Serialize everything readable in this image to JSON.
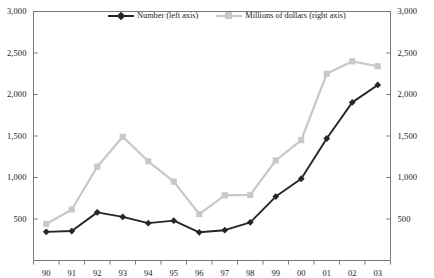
{
  "chart_data": {
    "type": "line",
    "title": "",
    "subtitle": "",
    "xlabel": "",
    "ylabel": "",
    "y2label": "",
    "categories": [
      "90",
      "91",
      "92",
      "93",
      "94",
      "95",
      "96",
      "97",
      "98",
      "99",
      "00",
      "01",
      "02",
      "03"
    ],
    "ylim": [
      0,
      3000
    ],
    "y2lim": [
      0,
      3000
    ],
    "yticks": [
      0,
      500,
      1000,
      1500,
      2000,
      2500,
      3000
    ],
    "ytick_labels": [
      "",
      "500",
      "1,000",
      "1,500",
      "2,000",
      "2,500",
      "3,000"
    ],
    "y2tick_labels": [
      "",
      "500",
      "1,000",
      "1,500",
      "2,000",
      "2,500",
      "3,000"
    ],
    "grid": false,
    "legend_position": "top-center",
    "series": [
      {
        "name": "Number (left axis)",
        "axis": "left",
        "color": "#262626",
        "marker": "diamond",
        "values": [
          345,
          355,
          580,
          525,
          450,
          480,
          340,
          365,
          460,
          770,
          985,
          1470,
          1905,
          2115
        ]
      },
      {
        "name": "Millions of dollars (right axis)",
        "axis": "right",
        "color": "#c8c8c8",
        "marker": "square",
        "values": [
          440,
          615,
          1130,
          1490,
          1195,
          950,
          560,
          785,
          790,
          1205,
          1450,
          2250,
          2400,
          2340
        ]
      }
    ]
  },
  "legend": {
    "entries": [
      {
        "label": "Number (left axis)"
      },
      {
        "label": "Millions of dollars (right axis)"
      }
    ]
  },
  "colors": {
    "series_number": "#262626",
    "series_dollars": "#c8c8c8",
    "axis": "#6b6b6b",
    "text": "#1a1a1a",
    "background": "#ffffff"
  }
}
